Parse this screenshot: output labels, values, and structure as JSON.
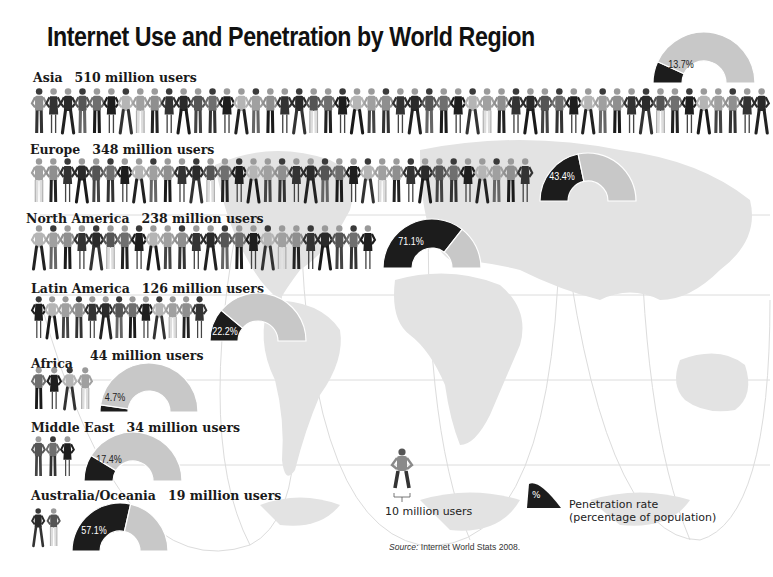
{
  "title": "Internet Use and Penetration by World Region",
  "colors": {
    "penetration": "#1c1c1c",
    "remainder": "#c8c8c8",
    "map_land": "#e4e4e4",
    "gridlines": "#d8d8d8"
  },
  "regions": [
    {
      "name": "Asia",
      "users_label": "510 million users",
      "users_millions": 510,
      "penetration_label": "13.7%",
      "penetration": 13.7,
      "figures": 51
    },
    {
      "name": "Europe",
      "users_label": "348 million users",
      "users_millions": 348,
      "penetration_label": "43.4%",
      "penetration": 43.4,
      "figures": 35
    },
    {
      "name": "North America",
      "users_label": "238 million users",
      "users_millions": 238,
      "penetration_label": "71.1%",
      "penetration": 71.1,
      "figures": 24
    },
    {
      "name": "Latin America",
      "users_label": "126 million users",
      "users_millions": 126,
      "penetration_label": "22.2%",
      "penetration": 22.2,
      "figures": 13
    },
    {
      "name": "Africa",
      "users_label": "44 million users",
      "users_millions": 44,
      "penetration_label": "4.7%",
      "penetration": 4.7,
      "figures": 4
    },
    {
      "name": "Middle East",
      "users_label": "34 million users",
      "users_millions": 34,
      "penetration_label": "17.4%",
      "penetration": 17.4,
      "figures": 3
    },
    {
      "name": "Australia/Oceania",
      "users_label": "19 million users",
      "users_millions": 19,
      "penetration_label": "57.1%",
      "penetration": 57.1,
      "figures": 2
    }
  ],
  "legend": {
    "figure_label": "10 million users",
    "wedge_symbol": "%",
    "wedge_label_line1": "Penetration rate",
    "wedge_label_line2": "(percentage of population)"
  },
  "source": {
    "prefix": "Source:",
    "text": "Internet World Stats 2008."
  },
  "chart_data": {
    "type": "pictograph + semicircle gauge",
    "title": "Internet Use and Penetration by World Region",
    "unit_figure": "1 figure = 10 million users",
    "categories": [
      "Asia",
      "Europe",
      "North America",
      "Latin America",
      "Africa",
      "Middle East",
      "Australia/Oceania"
    ],
    "series": [
      {
        "name": "Internet users (millions)",
        "values": [
          510,
          348,
          238,
          126,
          44,
          34,
          19
        ]
      },
      {
        "name": "Penetration rate (% of population)",
        "values": [
          13.7,
          43.4,
          71.1,
          22.2,
          4.7,
          17.4,
          57.1
        ]
      }
    ],
    "legend": [
      "10 million users",
      "Penetration rate (percentage of population)"
    ],
    "source": "Internet World Stats 2008."
  }
}
